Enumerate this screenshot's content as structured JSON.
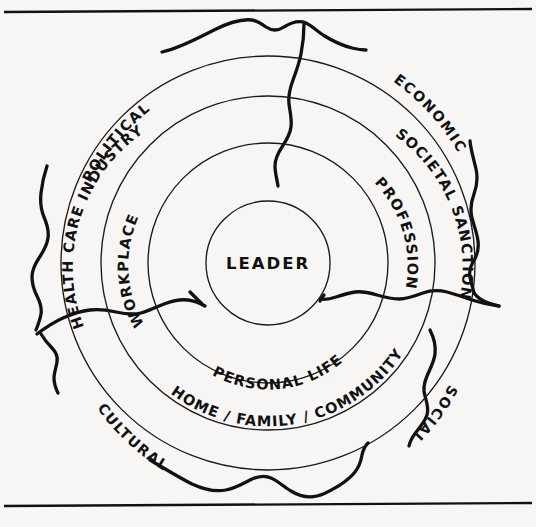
{
  "figure": {
    "type": "concentric-spheres-of-influence",
    "center": {
      "label": "LEADER"
    },
    "rings": [
      {
        "index": 1,
        "name": "personal-and-work-ring",
        "segments": [
          {
            "id": "workplace",
            "label": "WORKPLACE",
            "position": "upper-left"
          },
          {
            "id": "profession",
            "label": "PROFESSION",
            "position": "upper-right"
          },
          {
            "id": "personal-life",
            "label": "PERSONAL LIFE",
            "position": "bottom"
          }
        ]
      },
      {
        "index": 2,
        "name": "institutional-ring",
        "segments": [
          {
            "id": "health-care-industry",
            "label": "HEALTH CARE INDUSTRY",
            "position": "upper-left"
          },
          {
            "id": "societal-sanction",
            "label": "SOCIETAL SANCTION",
            "position": "upper-right"
          },
          {
            "id": "home-family-community",
            "label": "HOME / FAMILY / COMMUNITY",
            "position": "bottom"
          }
        ]
      }
    ],
    "environment": {
      "name": "external-environment",
      "labels": [
        {
          "id": "political",
          "label": "POLITICAL",
          "position": "upper-left"
        },
        {
          "id": "economic",
          "label": "ECONOMIC",
          "position": "upper-right"
        },
        {
          "id": "social",
          "label": "SOCIAL",
          "position": "lower-right"
        },
        {
          "id": "cultural",
          "label": "CULTURAL",
          "position": "lower-left"
        }
      ],
      "boundary_style": "irregular-hand-drawn",
      "penetrations": [
        {
          "id": "penetration-top",
          "from": "top"
        },
        {
          "id": "penetration-left",
          "from": "left"
        },
        {
          "id": "penetration-right",
          "from": "right"
        }
      ]
    },
    "colors": {
      "ink": "#111111",
      "ring_stroke": "#1a1a1a",
      "paper": "#f7f6f4"
    }
  }
}
